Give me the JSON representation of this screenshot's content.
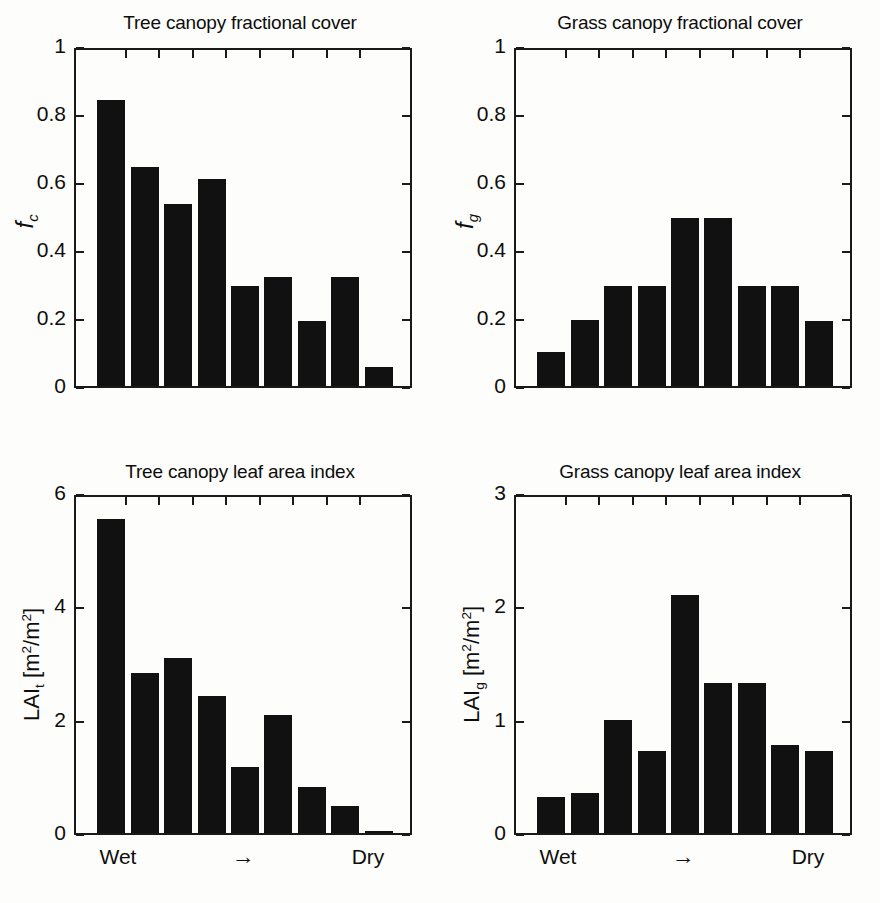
{
  "figure": {
    "background": "#fdfdfb",
    "bar_color": "#111111",
    "axis_color": "#1a1a1a",
    "panel_count": 4
  },
  "chart_data": [
    {
      "id": "tree-canopy-fractional-cover",
      "type": "bar",
      "title": "Tree canopy fractional cover",
      "ylabel": "f_c",
      "ylabel_base": "f",
      "ylabel_sub": "c",
      "xlabel": "",
      "ylim": [
        0,
        1
      ],
      "yticks": [
        0,
        0.2,
        0.4,
        0.6,
        0.8,
        1
      ],
      "ytick_labels": [
        "0",
        "0.2",
        "0.4",
        "0.6",
        "0.8",
        "1"
      ],
      "grid": false,
      "categories": [
        "1",
        "2",
        "3",
        "4",
        "5",
        "6",
        "7",
        "8",
        "9"
      ],
      "values": [
        0.84,
        0.645,
        0.535,
        0.61,
        0.295,
        0.32,
        0.19,
        0.32,
        0.055
      ],
      "x_axis_annotations": []
    },
    {
      "id": "grass-canopy-fractional-cover",
      "type": "bar",
      "title": "Grass canopy fractional cover",
      "ylabel": "f_g",
      "ylabel_base": "f",
      "ylabel_sub": "g",
      "xlabel": "",
      "ylim": [
        0,
        1
      ],
      "yticks": [
        0,
        0.2,
        0.4,
        0.6,
        0.8,
        1
      ],
      "ytick_labels": [
        "0",
        "0.2",
        "0.4",
        "0.6",
        "0.8",
        "1"
      ],
      "grid": false,
      "categories": [
        "1",
        "2",
        "3",
        "4",
        "5",
        "6",
        "7",
        "8",
        "9"
      ],
      "values": [
        0.1,
        0.195,
        0.295,
        0.295,
        0.495,
        0.495,
        0.295,
        0.295,
        0.19
      ],
      "x_axis_annotations": []
    },
    {
      "id": "tree-canopy-leaf-area-index",
      "type": "bar",
      "title": "Tree canopy leaf area index",
      "ylabel": "LAI_t [m2/m2]",
      "ylabel_base": "LAI",
      "ylabel_sub": "t",
      "ylabel_units_prefix": " [m",
      "ylabel_units_sup": "2",
      "ylabel_units_mid": "/m",
      "ylabel_units_sup2": "2",
      "ylabel_units_suffix": "]",
      "ylim": [
        0,
        6
      ],
      "yticks": [
        0,
        2,
        4,
        6
      ],
      "ytick_labels": [
        "0",
        "2",
        "4",
        "6"
      ],
      "grid": false,
      "categories": [
        "1",
        "2",
        "3",
        "4",
        "5",
        "6",
        "7",
        "8",
        "9"
      ],
      "values": [
        5.55,
        2.83,
        3.08,
        2.42,
        1.17,
        2.08,
        0.82,
        0.47,
        0.03
      ],
      "x_axis_annotations": [
        {
          "label": "Wet",
          "position": 0.13
        },
        {
          "label": "arrow-right-glyph",
          "position": 0.5,
          "glyph": "→"
        },
        {
          "label": "Dry",
          "position": 0.87
        }
      ]
    },
    {
      "id": "grass-canopy-leaf-area-index",
      "type": "bar",
      "title": "Grass canopy leaf area index",
      "ylabel": "LAI_g [m2/m2]",
      "ylabel_base": "LAI",
      "ylabel_sub": "g",
      "ylabel_units_prefix": " [m",
      "ylabel_units_sup": "2",
      "ylabel_units_mid": "/m",
      "ylabel_units_sup2": "2",
      "ylabel_units_suffix": "]",
      "ylim": [
        0,
        3
      ],
      "yticks": [
        0,
        1,
        2,
        3
      ],
      "ytick_labels": [
        "0",
        "1",
        "2",
        "3"
      ],
      "grid": false,
      "categories": [
        "1",
        "2",
        "3",
        "4",
        "5",
        "6",
        "7",
        "8",
        "9"
      ],
      "values": [
        0.32,
        0.35,
        1.0,
        0.72,
        2.1,
        1.32,
        1.32,
        0.78,
        0.72
      ],
      "x_axis_annotations": [
        {
          "label": "Wet",
          "position": 0.13
        },
        {
          "label": "arrow-right-glyph",
          "position": 0.5,
          "glyph": "→"
        },
        {
          "label": "Dry",
          "position": 0.87
        }
      ]
    }
  ],
  "axis_labels": {
    "wet": "Wet",
    "dry": "Dry",
    "arrow": "→"
  }
}
